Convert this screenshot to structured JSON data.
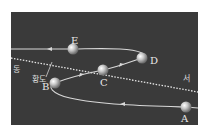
{
  "diagram": {
    "type": "retrograde-motion",
    "background_color": "#3a3a3a",
    "path_color": "#d8d8d8",
    "ecliptic_color": "#e0e0e0",
    "ecliptic_label": "황도",
    "direction_east": "동",
    "direction_west": "서",
    "points": [
      {
        "label": "A",
        "x": 186,
        "y": 107
      },
      {
        "label": "B",
        "x": 55,
        "y": 83
      },
      {
        "label": "C",
        "x": 103,
        "y": 70
      },
      {
        "label": "D",
        "x": 142,
        "y": 58
      },
      {
        "label": "E",
        "x": 73,
        "y": 49
      }
    ]
  }
}
